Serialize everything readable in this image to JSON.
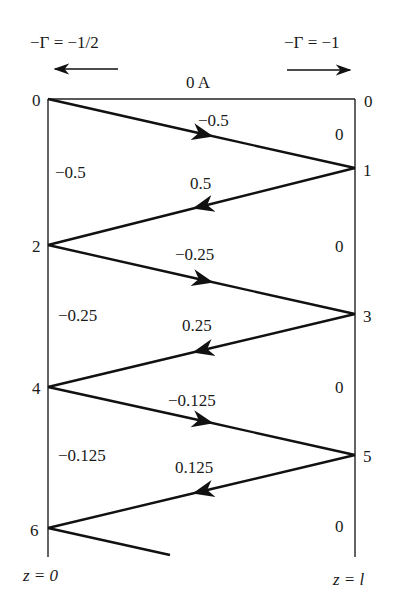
{
  "diagram": {
    "type": "bounce-diagram",
    "header": {
      "left_reflection": "−Γ = −1/2",
      "right_reflection": "−Γ = −1",
      "initial_current": "0 A"
    },
    "axis_labels": {
      "left": "z = 0",
      "right": "z = l"
    },
    "left_time_ticks": [
      "0",
      "2",
      "4",
      "6"
    ],
    "right_time_ticks": [
      "0",
      "1",
      "3",
      "5"
    ],
    "wave_labels": [
      "−0.5",
      "0.5",
      "−0.25",
      "0.25",
      "−0.125",
      "0.125"
    ],
    "left_region_values": [
      "−0.5",
      "−0.25",
      "−0.125"
    ],
    "right_region_values": [
      "0",
      "0",
      "0",
      "0"
    ]
  }
}
